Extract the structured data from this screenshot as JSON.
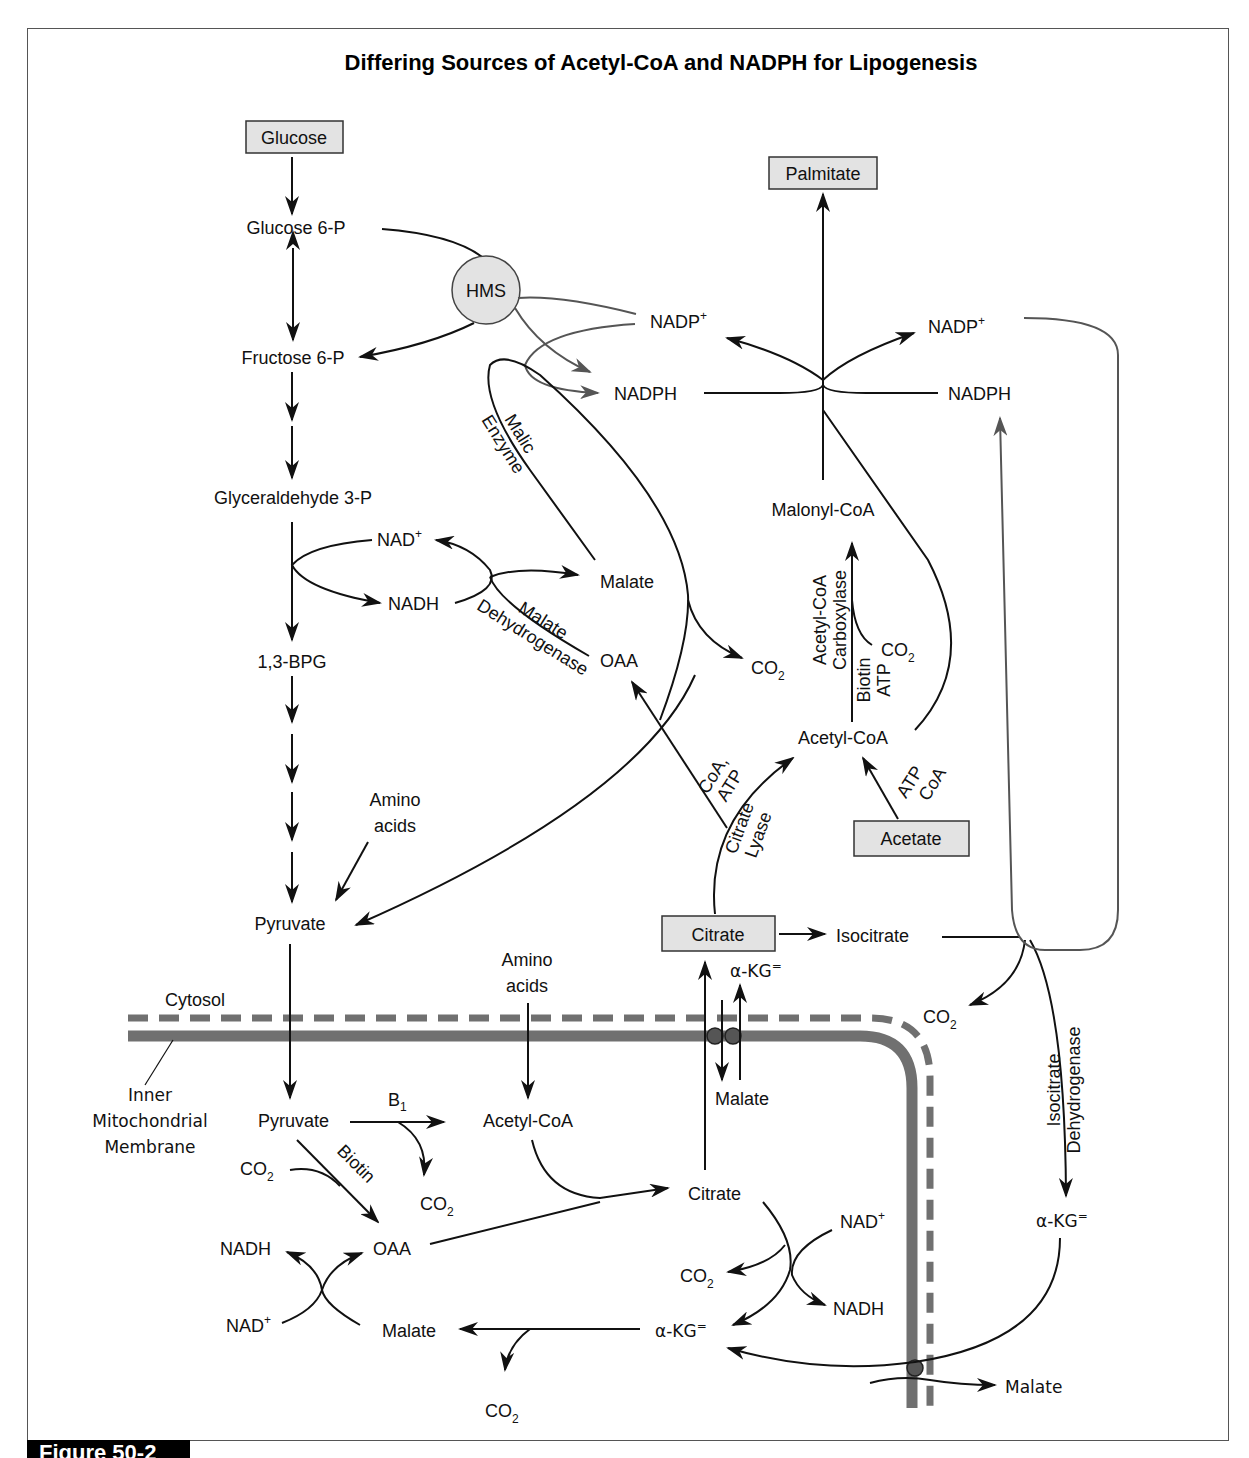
{
  "title": "Differing Sources of Acetyl-CoA and NADPH for Lipogenesis",
  "figure_label": "Figure 50-2",
  "colors": {
    "box_fill": "#e3e3e3",
    "membrane": "#707070",
    "line": "#111111",
    "nadph_loop_line": "#555555"
  },
  "boxed_nodes": {
    "glucose": "Glucose",
    "palmitate": "Palmitate",
    "acetate": "Acetate",
    "citrate_cyto": "Citrate",
    "hms": "HMS"
  },
  "cytosol": {
    "glucose_6p": "Glucose 6-P",
    "fructose_6p": "Fructose 6-P",
    "glyceraldehyde_3p": "Glyceraldehyde 3-P",
    "bpg": "1,3-BPG",
    "pyruvate": "Pyruvate",
    "amino_acids_1": "Amino",
    "amino_acids_2": "acids",
    "nad_plus": "NAD",
    "nadh": "NADH",
    "malate": "Malate",
    "oaa": "OAA",
    "co2_malic": "CO",
    "nadp_left": "NADP",
    "nadph_left": "NADPH",
    "nadp_right": "NADP",
    "nadph_right": "NADPH",
    "malonyl_coa": "Malonyl-CoA",
    "acetyl_coa": "Acetyl-CoA",
    "co2_acc": "CO",
    "isocitrate": "Isocitrate",
    "co2_idh": "CO",
    "akg_cyto": "α-KG",
    "akg_transport": "α-KG",
    "malate_transport": "Malate",
    "cytosol_label": "Cytosol"
  },
  "enzymes": {
    "malic_enzyme_1": "Malic",
    "malic_enzyme_2": "Enzyme",
    "mdh_1": "Malate",
    "mdh_2": "Dehydrogenase",
    "acc_1": "Acetyl-CoA",
    "acc_2": "Carboxylase",
    "acc_cof_1": "Biotin",
    "acc_cof_2": "ATP",
    "citrate_lyase_1": "Citrate",
    "citrate_lyase_2": "Lyase",
    "cl_cof_1": "CoA,",
    "cl_cof_2": "ATP",
    "acetate_cof_1": "ATP",
    "acetate_cof_2": "CoA",
    "idh_1": "Isocitrate",
    "idh_2": "Dehydrogenase"
  },
  "mitochondria": {
    "membrane_label_1": "Inner",
    "membrane_label_2": "Mitochondrial",
    "membrane_label_3": "Membrane",
    "pyruvate": "Pyruvate",
    "b1": "B",
    "b1_sub": "1",
    "biotin": "Biotin",
    "co2_in": "CO",
    "co2_pdh": "CO",
    "acetyl_coa": "Acetyl-CoA",
    "amino_acids_1": "Amino",
    "amino_acids_2": "acids",
    "oaa": "OAA",
    "citrate": "Citrate",
    "nadh_left": "NADH",
    "nad_left": "NAD",
    "malate": "Malate",
    "co2_malate": "CO",
    "akg": "α-KG",
    "co2_akg": "CO",
    "nad_right": "NAD",
    "nadh_right": "NADH",
    "malate_out": "Malate"
  },
  "symbols": {
    "plus": "+",
    "sub2": "2",
    "dianion": "="
  }
}
